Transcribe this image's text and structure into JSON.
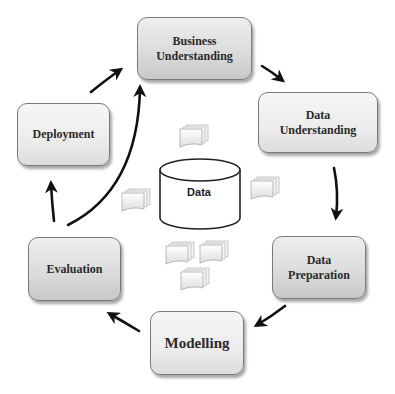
{
  "diagram": {
    "stages": [
      {
        "id": "business",
        "label": "Business\nUnderstanding"
      },
      {
        "id": "data_understanding",
        "label": "Data\nUnderstanding"
      },
      {
        "id": "data_preparation",
        "label": "Data\nPreparation"
      },
      {
        "id": "modelling",
        "label": "Modelling"
      },
      {
        "id": "evaluation",
        "label": "Evaluation"
      },
      {
        "id": "deployment",
        "label": "Deployment"
      }
    ],
    "center": {
      "label": "Data",
      "icon": "database-cylinder-icon"
    },
    "edges": [
      {
        "from": "business",
        "to": "data_understanding"
      },
      {
        "from": "data_understanding",
        "to": "data_preparation"
      },
      {
        "from": "data_preparation",
        "to": "modelling"
      },
      {
        "from": "modelling",
        "to": "evaluation"
      },
      {
        "from": "evaluation",
        "to": "deployment"
      },
      {
        "from": "evaluation",
        "to": "business"
      },
      {
        "from": "deployment",
        "to": "business"
      }
    ],
    "colors": {
      "box_top": "#eeeeee",
      "box_bottom": "#c8c8c8",
      "border": "#7a7a7a",
      "arrow": "#111111",
      "text": "#2a2a2a"
    }
  }
}
